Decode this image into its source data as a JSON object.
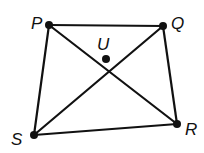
{
  "diagram": {
    "type": "quadrilateral-with-diagonals",
    "points": {
      "P": {
        "label": "P",
        "x": 49,
        "y": 25,
        "label_x": 31,
        "label_y": 29
      },
      "Q": {
        "label": "Q",
        "x": 163,
        "y": 26,
        "label_x": 171,
        "label_y": 29
      },
      "U": {
        "label": "U",
        "x": 106,
        "y": 59,
        "label_x": 97,
        "label_y": 50
      },
      "S": {
        "label": "S",
        "x": 34,
        "y": 135,
        "label_x": 11,
        "label_y": 145
      },
      "R": {
        "label": "R",
        "x": 177,
        "y": 124,
        "label_x": 185,
        "label_y": 135
      }
    },
    "segments": [
      [
        "P",
        "Q"
      ],
      [
        "Q",
        "R"
      ],
      [
        "R",
        "S"
      ],
      [
        "S",
        "P"
      ],
      [
        "P",
        "R"
      ],
      [
        "Q",
        "S"
      ]
    ],
    "colors": {
      "line": "#111111",
      "background": "#ffffff"
    }
  }
}
